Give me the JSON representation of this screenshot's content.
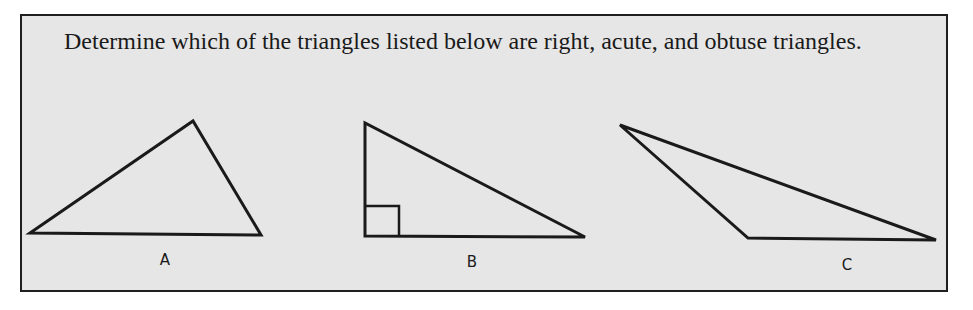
{
  "problem": {
    "prompt": "Determine which of the triangles listed below are right, acute, and obtuse triangles."
  },
  "colors": {
    "panel_background": "#e6e6e6",
    "stroke": "#1a1a1a"
  },
  "triangles": [
    {
      "label": "A",
      "points": "30,233 193,121 261,235",
      "label_pos": [
        165,
        260
      ]
    },
    {
      "label": "B",
      "points": "365,123 365,236 585,237",
      "label_pos": [
        472,
        262
      ],
      "right_angle_marker": "365,206 399,206 399,236"
    },
    {
      "label": "C",
      "points": "620,125 748,238 936,240",
      "label_pos": [
        847,
        265
      ]
    }
  ]
}
